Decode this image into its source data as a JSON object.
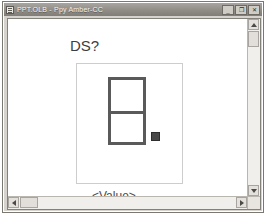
{
  "window": {
    "title": "PPT.OLB - Ppy Amber-CC",
    "icon": "document-icon",
    "controls": {
      "minimize_label": "_",
      "maximize_label": "❐",
      "close_label": "✕"
    }
  },
  "slide": {
    "title": "DS?",
    "placeholder_label": "<Value>",
    "shape": {
      "name": "table-shape",
      "rows": 2,
      "columns": 1,
      "border_color": "#5a5a5a",
      "fill_color": "#ffffff"
    },
    "frame_border_color": "#cdcdcd",
    "selection_handle_color": "#4a4a4a"
  },
  "scrollbars": {
    "vertical": {
      "up_arrow": "▲",
      "down_arrow": "▼"
    },
    "horizontal": {
      "left_arrow": "◀",
      "right_arrow": "▶"
    }
  }
}
